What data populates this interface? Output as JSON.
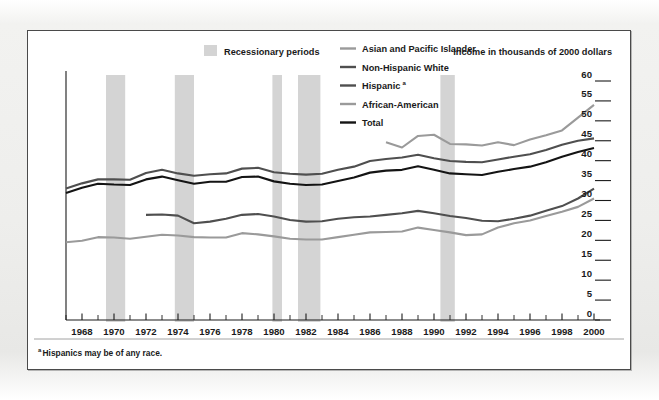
{
  "figure": {
    "axis_title": "Income in thousands of 2000 dollars",
    "footnote": "Hispanics may be of any race.",
    "footnote_marker": "a",
    "recession_legend_label": "Recessionary periods",
    "recession_band_color": "#d4d4d4"
  },
  "chart_data": {
    "type": "line",
    "title": "",
    "subtitle": "",
    "xlabel": "",
    "ylabel": "Income in thousands of 2000 dollars",
    "xlim": [
      1967,
      2000
    ],
    "ylim": [
      0,
      60
    ],
    "ytick_step": 5,
    "grid": false,
    "legend_position": "top",
    "y_ticks": [
      0,
      5,
      10,
      15,
      20,
      25,
      30,
      35,
      40,
      45,
      50,
      55,
      60
    ],
    "x_ticks_major": [
      1968,
      1970,
      1972,
      1974,
      1976,
      1978,
      1980,
      1982,
      1984,
      1986,
      1988,
      1990,
      1992,
      1994,
      1996,
      1998,
      2000
    ],
    "x_ticks_minor": [
      1967,
      1969,
      1971,
      1973,
      1975,
      1977,
      1979,
      1981,
      1983,
      1985,
      1987,
      1989,
      1991,
      1993,
      1995,
      1997,
      1999
    ],
    "annotations": [
      {
        "text": "Recessionary periods",
        "kind": "legend-swatch"
      },
      {
        "text": "aHispanics may be of any race.",
        "kind": "footnote"
      }
    ],
    "shaded_regions": [
      {
        "label": "Recession 1969-1970",
        "x0": 1969.5,
        "x1": 1970.7
      },
      {
        "label": "Recession 1973-1975",
        "x0": 1973.8,
        "x1": 1975.0
      },
      {
        "label": "Recession 1980",
        "x0": 1979.9,
        "x1": 1980.5
      },
      {
        "label": "Recession 1981-1982",
        "x0": 1981.5,
        "x1": 1982.9
      },
      {
        "label": "Recession 1990-1991",
        "x0": 1990.4,
        "x1": 1991.3
      }
    ],
    "series": [
      {
        "name": "Asian and Pacific Islander",
        "color": "#9a9a9a",
        "x": [
          1987,
          1988,
          1989,
          1990,
          1991,
          1992,
          1993,
          1994,
          1995,
          1996,
          1997,
          1998,
          1999,
          2000
        ],
        "values": [
          44.6,
          43.3,
          46.2,
          46.5,
          44.2,
          44.1,
          43.8,
          44.6,
          43.9,
          45.3,
          46.4,
          47.6,
          50.8,
          54.0
        ]
      },
      {
        "name": "Non-Hispanic White",
        "color": "#4f4f4f",
        "x": [
          1967,
          1968,
          1969,
          1970,
          1971,
          1972,
          1973,
          1974,
          1975,
          1976,
          1977,
          1978,
          1979,
          1980,
          1981,
          1982,
          1983,
          1984,
          1985,
          1986,
          1987,
          1988,
          1989,
          1990,
          1991,
          1992,
          1993,
          1994,
          1995,
          1996,
          1997,
          1998,
          1999,
          2000
        ],
        "values": [
          33.0,
          34.3,
          35.3,
          35.3,
          35.2,
          36.9,
          37.7,
          36.8,
          36.2,
          36.6,
          36.8,
          38.0,
          38.2,
          37.1,
          36.7,
          36.5,
          36.7,
          37.7,
          38.5,
          39.9,
          40.4,
          40.8,
          41.5,
          40.6,
          39.9,
          39.7,
          39.6,
          40.3,
          41.0,
          41.6,
          42.7,
          44.0,
          45.0,
          45.6
        ]
      },
      {
        "name": "Hispanic",
        "color": "#4f4f4f",
        "x": [
          1972,
          1973,
          1974,
          1975,
          1976,
          1977,
          1978,
          1979,
          1980,
          1981,
          1982,
          1983,
          1984,
          1985,
          1986,
          1987,
          1988,
          1989,
          1990,
          1991,
          1992,
          1993,
          1994,
          1995,
          1996,
          1997,
          1998,
          1999,
          2000
        ],
        "values": [
          26.4,
          26.5,
          26.2,
          24.3,
          24.7,
          25.4,
          26.4,
          26.6,
          26.0,
          25.1,
          24.7,
          24.8,
          25.4,
          25.8,
          26.0,
          26.4,
          26.8,
          27.4,
          26.8,
          26.1,
          25.6,
          24.9,
          24.8,
          25.4,
          26.2,
          27.4,
          28.6,
          30.5,
          33.0
        ]
      },
      {
        "name": "African-American",
        "color": "#9a9a9a",
        "x": [
          1967,
          1968,
          1969,
          1970,
          1971,
          1972,
          1973,
          1974,
          1975,
          1976,
          1977,
          1978,
          1979,
          1980,
          1981,
          1982,
          1983,
          1984,
          1985,
          1986,
          1987,
          1988,
          1989,
          1990,
          1991,
          1992,
          1993,
          1994,
          1995,
          1996,
          1997,
          1998,
          1999,
          2000
        ],
        "values": [
          19.5,
          19.9,
          20.8,
          20.7,
          20.4,
          20.9,
          21.4,
          21.2,
          20.8,
          20.7,
          20.7,
          21.8,
          21.5,
          21.0,
          20.4,
          20.2,
          20.2,
          20.8,
          21.4,
          22.0,
          22.1,
          22.2,
          23.2,
          22.6,
          22.0,
          21.3,
          21.5,
          23.2,
          24.3,
          25.0,
          26.1,
          27.2,
          28.4,
          30.5
        ]
      },
      {
        "name": "Total",
        "color": "#141414",
        "x": [
          1967,
          1968,
          1969,
          1970,
          1971,
          1972,
          1973,
          1974,
          1975,
          1976,
          1977,
          1978,
          1979,
          1980,
          1981,
          1982,
          1983,
          1984,
          1985,
          1986,
          1987,
          1988,
          1989,
          1990,
          1991,
          1992,
          1993,
          1994,
          1995,
          1996,
          1997,
          1998,
          1999,
          2000
        ],
        "values": [
          31.9,
          33.2,
          34.2,
          34.0,
          33.9,
          35.3,
          36.0,
          35.1,
          34.2,
          34.7,
          34.7,
          35.9,
          36.0,
          34.8,
          34.2,
          33.9,
          34.0,
          34.9,
          35.8,
          37.0,
          37.5,
          37.7,
          38.6,
          37.7,
          36.8,
          36.6,
          36.4,
          37.2,
          37.9,
          38.5,
          39.6,
          41.0,
          42.2,
          43.2
        ]
      }
    ]
  },
  "legend": {
    "recession": {
      "label": "Recessionary periods",
      "color": "#d4d4d4"
    },
    "items": [
      {
        "label": "Asian and Pacific Islander",
        "color": "#9a9a9a"
      },
      {
        "label": "Non-Hispanic White",
        "color": "#4f4f4f"
      },
      {
        "label": "Hispanic",
        "color": "#4f4f4f",
        "superscript": "a"
      },
      {
        "label": "African-American",
        "color": "#9a9a9a"
      },
      {
        "label": "Total",
        "color": "#141414"
      }
    ]
  }
}
